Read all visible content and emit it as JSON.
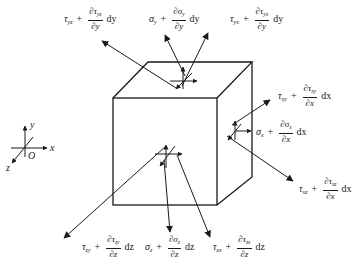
{
  "figure": {
    "axes": {
      "x": "x",
      "y": "y",
      "z": "z",
      "origin": "O"
    },
    "labels": {
      "top_left": {
        "sym": "τ",
        "sub": "yz",
        "num": "∂τ",
        "num_sub": "yz",
        "den": "∂y",
        "d": "dy"
      },
      "top_mid": {
        "sym": "σ",
        "sub": "y",
        "num": "∂σ",
        "num_sub": "y",
        "den": "∂y",
        "d": "dy"
      },
      "top_right": {
        "sym": "τ",
        "sub": "yx",
        "num": "∂τ",
        "num_sub": "yx",
        "den": "∂y",
        "d": "dy"
      },
      "right_top": {
        "sym": "τ",
        "sub": "xy",
        "num": "∂τ",
        "num_sub": "xy",
        "den": "∂x",
        "d": "dx"
      },
      "right_mid": {
        "sym": "σ",
        "sub": "x",
        "num": "∂σ",
        "num_sub": "x",
        "den": "∂x",
        "d": "dx"
      },
      "right_bot": {
        "sym": "τ",
        "sub": "xz",
        "num": "∂τ",
        "num_sub": "xz",
        "den": "∂x",
        "d": "dx"
      },
      "bot_left": {
        "sym": "τ",
        "sub": "zy",
        "num": "∂τ",
        "num_sub": "zy",
        "den": "∂z",
        "d": "dz"
      },
      "bot_mid": {
        "sym": "σ",
        "sub": "z",
        "num": "∂σ",
        "num_sub": "z",
        "den": "∂z",
        "d": "dz"
      },
      "bot_right": {
        "sym": "τ",
        "sub": "zx",
        "num": "∂τ",
        "num_sub": "zx",
        "den": "∂z",
        "d": "dz"
      }
    },
    "plus": "+",
    "colors": {
      "ink": "#1a1a1a",
      "background": "#ffffff"
    }
  }
}
